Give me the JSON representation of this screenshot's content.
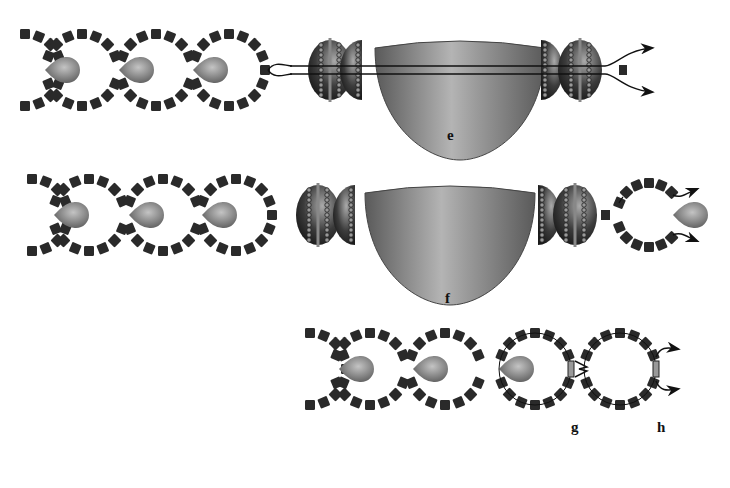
{
  "figure": {
    "panels": [
      {
        "id": "e",
        "label": "e",
        "label_pos": [
          447,
          140
        ]
      },
      {
        "id": "f",
        "label": "f",
        "label_pos": [
          445,
          303
        ]
      },
      {
        "id": "g",
        "label": "g",
        "label_pos": [
          573,
          432
        ]
      },
      {
        "id": "h",
        "label": "h",
        "label_pos": [
          660,
          432
        ]
      }
    ],
    "colors": {
      "block": "#2a2a2a",
      "drop_light": "#b0b0b0",
      "drop_dark": "#6a6a6a",
      "body_light": "#b8b8b8",
      "body_dark": "#5e5e5e",
      "line": "#111111",
      "background": "#ffffff"
    },
    "row_e": {
      "cy": 70,
      "loops_cx": [
        82,
        156,
        229
      ],
      "loop_r": 36,
      "drops_cx": [
        61,
        135,
        209
      ],
      "big_body": {
        "x": 375,
        "y": 40,
        "w": 170,
        "h": 120
      },
      "beads_cx": [
        330,
        362,
        541,
        580
      ],
      "small_block_x": 622
    },
    "row_f": {
      "cy": 215,
      "loops_cx": [
        89,
        163,
        236
      ],
      "loop_r": 36,
      "drops_cx": [
        70,
        145,
        218
      ],
      "big_body": {
        "x": 365,
        "y": 185,
        "w": 170,
        "h": 120
      },
      "beads_cx": [
        318,
        355,
        538,
        575
      ],
      "open_loop_cx": 649,
      "open_loop_r": 32,
      "small_block_x": 605
    },
    "row_gh": {
      "cy": 369,
      "loops_cx": [
        370,
        445,
        535,
        620
      ],
      "loop_r": 36,
      "drops_cx": [
        355,
        429,
        515
      ]
    }
  }
}
